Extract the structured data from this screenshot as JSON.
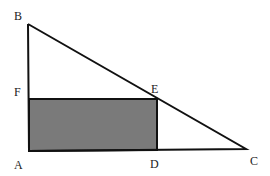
{
  "diagram": {
    "type": "geometry",
    "colors": {
      "stroke": "#111111",
      "shade": "#7a7a7a",
      "background": "#ffffff"
    },
    "points": {
      "A": {
        "label": "A",
        "x": 29,
        "y": 151
      },
      "B": {
        "label": "B",
        "x": 28,
        "y": 24
      },
      "C": {
        "label": "C",
        "x": 246,
        "y": 149
      },
      "D": {
        "label": "D",
        "x": 157,
        "y": 150
      },
      "E": {
        "label": "E",
        "x": 157,
        "y": 99
      },
      "F": {
        "label": "F",
        "x": 29,
        "y": 99
      }
    },
    "labels": {
      "A": "A",
      "B": "B",
      "C": "C",
      "D": "D",
      "E": "E",
      "F": "F"
    },
    "shapes": {
      "triangle": "ABC",
      "shaded_rectangle": "AFED"
    }
  }
}
